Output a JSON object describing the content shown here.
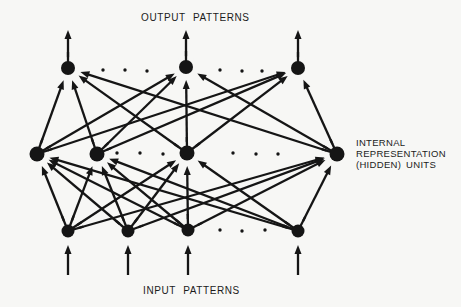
{
  "figure": {
    "background": "#f7f7f5",
    "ink": "#151515",
    "labels": {
      "output": "OUTPUT PATTERNS",
      "input": "INPUT PATTERNS",
      "hidden": "INTERNAL\nREPRESENTATION\n(HIDDEN) UNITS"
    },
    "diagram": {
      "width": 461,
      "height": 307,
      "line_width": 2.3,
      "halo_radius": 11,
      "arrow_gap": 13,
      "head_length": 9,
      "head_halfwidth": 3.5,
      "stub_length": 16,
      "layers": {
        "output": {
          "label": "output units",
          "radius": 7,
          "nodes": [
            [
              68,
              68
            ],
            [
              186,
              67
            ],
            [
              298,
              68
            ]
          ]
        },
        "hidden": {
          "label": "hidden units",
          "radius": 7.5,
          "nodes": [
            [
              37,
              154
            ],
            [
              97,
              154
            ],
            [
              187,
              153
            ],
            [
              337,
              154
            ]
          ]
        },
        "input": {
          "label": "input units",
          "radius": 6.5,
          "nodes": [
            [
              68,
              231
            ],
            [
              128,
              231
            ],
            [
              188,
              230
            ],
            [
              298,
              231
            ]
          ]
        }
      },
      "connections": {
        "input_to_hidden": "full",
        "hidden_to_output": "full"
      },
      "output_arrows": {
        "tip_y": 30
      },
      "input_arrows": {
        "tail_y": 275,
        "tip_y": 245
      },
      "ellipsis_dots": {
        "dot_radius": 1.7,
        "output_row": [
          [
            103,
            70
          ],
          [
            125,
            70
          ],
          [
            147,
            71
          ],
          [
            220,
            70
          ],
          [
            242,
            71
          ],
          [
            262,
            71
          ]
        ],
        "hidden_row": [
          [
            117,
            153
          ],
          [
            140,
            153
          ],
          [
            163,
            154
          ],
          [
            233,
            153
          ],
          [
            256,
            154
          ],
          [
            278,
            154
          ]
        ],
        "input_row": [
          [
            220,
            230
          ],
          [
            242,
            231
          ],
          [
            265,
            230
          ]
        ]
      }
    }
  }
}
